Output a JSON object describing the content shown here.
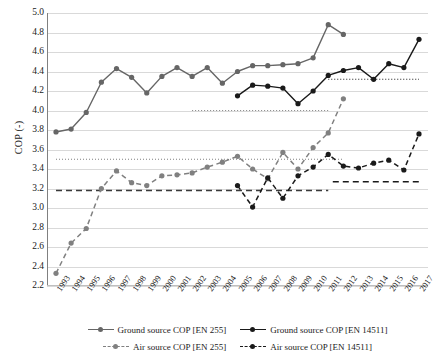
{
  "chart_data": {
    "type": "line",
    "title": "",
    "xlabel": "",
    "ylabel": "COP (-)",
    "ylim": [
      2.2,
      5.0
    ],
    "ytick_step": 0.2,
    "grid": true,
    "legend_position": "bottom",
    "x": [
      1993,
      1994,
      1995,
      1996,
      1997,
      1998,
      1999,
      2000,
      2001,
      2002,
      2003,
      2004,
      2005,
      2006,
      2007,
      2008,
      2009,
      2010,
      2011,
      2012,
      2013,
      2014,
      2015,
      2016,
      2017
    ],
    "yticks": [
      "2.2",
      "2.4",
      "2.6",
      "2.8",
      "3.0",
      "3.2",
      "3.4",
      "3.6",
      "3.8",
      "4.0",
      "4.2",
      "4.4",
      "4.6",
      "4.8",
      "5.0"
    ],
    "xticks": [
      "1993",
      "1994",
      "1995",
      "1996",
      "1997",
      "1998",
      "1999",
      "2000",
      "2001",
      "2002",
      "2003",
      "2004",
      "2005",
      "2006",
      "2007",
      "2008",
      "2009",
      "2010",
      "2011",
      "2012",
      "2013",
      "2014",
      "2015",
      "2016",
      "2017"
    ],
    "series": [
      {
        "name": "Ground source COP [EN 255]",
        "color": "#666666",
        "dash": "solid",
        "x": [
          1993,
          1994,
          1995,
          1996,
          1997,
          1998,
          1999,
          2000,
          2001,
          2002,
          2003,
          2004,
          2005,
          2006,
          2007,
          2008,
          2009,
          2010,
          2011,
          2012
        ],
        "values": [
          3.78,
          3.81,
          3.98,
          4.29,
          4.43,
          4.34,
          4.18,
          4.35,
          4.44,
          4.35,
          4.44,
          4.28,
          4.4,
          4.46,
          4.46,
          4.47,
          4.48,
          4.54,
          4.88,
          4.78
        ]
      },
      {
        "name": "Ground source COP [EN 14511]",
        "color": "#1a1a1a",
        "dash": "solid",
        "x": [
          2005,
          2006,
          2007,
          2008,
          2009,
          2010,
          2011,
          2012,
          2013,
          2014,
          2015,
          2016,
          2017
        ],
        "values": [
          4.15,
          4.26,
          4.25,
          4.23,
          4.07,
          4.2,
          4.36,
          4.41,
          4.44,
          4.32,
          4.48,
          4.44,
          4.73
        ]
      },
      {
        "name": "Air source COP [EN 255]",
        "color": "#808080",
        "dash": "dashed",
        "x": [
          1993,
          1994,
          1995,
          1996,
          1997,
          1998,
          1999,
          2000,
          2001,
          2002,
          2003,
          2004,
          2005,
          2006,
          2007,
          2008,
          2009,
          2010,
          2011,
          2012
        ],
        "values": [
          2.33,
          2.64,
          2.79,
          3.2,
          3.38,
          3.26,
          3.23,
          3.33,
          3.34,
          3.36,
          3.42,
          3.47,
          3.53,
          3.4,
          3.3,
          3.57,
          3.4,
          3.62,
          3.77,
          4.12
        ]
      },
      {
        "name": "Air source COP [EN 14511]",
        "color": "#1a1a1a",
        "dash": "dashed",
        "x": [
          2005,
          2006,
          2007,
          2008,
          2009,
          2010,
          2011,
          2012,
          2013,
          2014,
          2015,
          2016,
          2017
        ],
        "values": [
          3.23,
          3.01,
          3.31,
          3.1,
          3.33,
          3.42,
          3.55,
          3.43,
          3.41,
          3.46,
          3.49,
          3.39,
          3.76
        ]
      }
    ],
    "reference_lines": [
      {
        "name": "avg-air-en255",
        "value": 3.5,
        "x_start": 1993,
        "x_end": 2012,
        "style": "dotted",
        "color": "#808080"
      },
      {
        "name": "avg-air-en14511",
        "value": 3.18,
        "x_start": 1993,
        "x_end": 2011,
        "style": "dashed",
        "color": "#3a3a3a"
      },
      {
        "name": "avg-air-en14511-late",
        "value": 3.27,
        "x_start": 2011.3,
        "x_end": 2017,
        "style": "dashed",
        "color": "#1a1a1a"
      },
      {
        "name": "avg-ground-en255",
        "value": 4.0,
        "x_start": 2002,
        "x_end": 2011,
        "style": "dotted",
        "color": "#808080"
      },
      {
        "name": "avg-ground-en14511",
        "value": 4.32,
        "x_start": 2011,
        "x_end": 2017,
        "style": "dotted",
        "color": "#1a1a1a"
      }
    ]
  },
  "legend": {
    "rows": [
      [
        {
          "label": "Ground source COP [EN 255]",
          "color": "#666666",
          "dash": "solid"
        },
        {
          "label": "Ground source COP [EN 14511]",
          "color": "#1a1a1a",
          "dash": "solid"
        }
      ],
      [
        {
          "label": "Air source COP [EN 255]",
          "color": "#808080",
          "dash": "dashed"
        },
        {
          "label": "Air source COP [EN 14511]",
          "color": "#1a1a1a",
          "dash": "dashed"
        }
      ]
    ]
  }
}
